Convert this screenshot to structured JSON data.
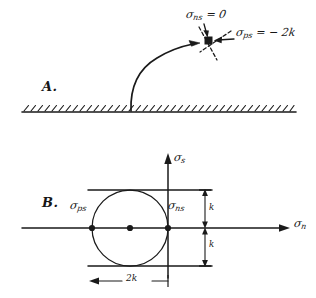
{
  "figure": {
    "ink_color": "#1a1a1a",
    "background": "#ffffff",
    "panels": [
      {
        "id": "A",
        "letter": "A.",
        "description": "Slip-line curve rising from hatched free surface to a stress point",
        "annotations": [
          {
            "name": "sigma-ns-zero",
            "symbol": "σ",
            "subscript": "ns",
            "relation": "= 0",
            "text": "σns = 0"
          },
          {
            "name": "sigma-ps-minus-2k",
            "symbol": "σ",
            "subscript": "ps",
            "relation": "= − 2 k",
            "text": "σps = − 2k"
          }
        ]
      },
      {
        "id": "B",
        "letter": "B.",
        "description": "Mohr circle of radius k tangent to the sigma-s axis at the origin",
        "axes": {
          "vertical": {
            "name": "sigma-s-axis",
            "symbol": "σ",
            "subscript": "s",
            "text": "σs"
          },
          "horizontal": {
            "name": "sigma-n-axis",
            "symbol": "σ",
            "subscript": "n",
            "text": "σn"
          }
        },
        "points": [
          {
            "name": "sigma-ps-point",
            "symbol": "σ",
            "subscript": "ps",
            "text": "σps",
            "position": "left intersection of circle with sigma-n axis"
          },
          {
            "name": "circle-center-point",
            "text": "",
            "position": "center of circle on sigma-n axis"
          },
          {
            "name": "sigma-ns-point",
            "symbol": "σ",
            "subscript": "ns",
            "text": "σns",
            "position": "right intersection, at origin"
          }
        ],
        "dimensions": [
          {
            "name": "dimension-k-upper",
            "text": "k",
            "orientation": "vertical",
            "value": "k"
          },
          {
            "name": "dimension-k-lower",
            "text": "k",
            "orientation": "vertical",
            "value": "k"
          },
          {
            "name": "dimension-2k",
            "text": "2k",
            "orientation": "horizontal",
            "value": "2k"
          }
        ]
      }
    ]
  },
  "labels": {
    "panel_a_letter": "A.",
    "panel_b_letter": "B.",
    "sigma_glyph": "σ",
    "sub_ns": "ns",
    "sub_ps": "ps",
    "sub_s": "s",
    "sub_n": "n",
    "eq_zero": "= 0",
    "eq_minus_2k": "= − 2k",
    "k": "k",
    "two_k": "2k"
  }
}
